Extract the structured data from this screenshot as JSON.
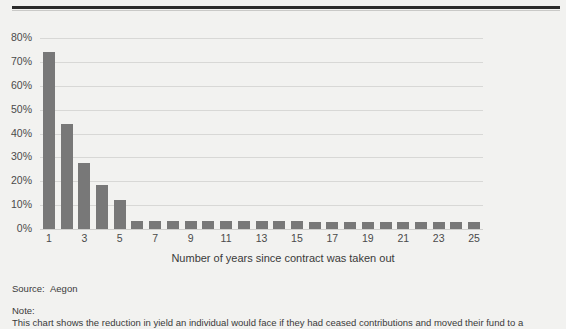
{
  "chart_data": {
    "type": "bar",
    "title": "",
    "xlabel": "Number of years since contract was taken out",
    "ylabel": "",
    "ylim": [
      0,
      80
    ],
    "grid": true,
    "legend": "none",
    "ytick_labels": [
      "80%",
      "70%",
      "60%",
      "50%",
      "40%",
      "30%",
      "20%",
      "10%",
      "0%"
    ],
    "ytick_values": [
      80,
      70,
      60,
      50,
      40,
      30,
      20,
      10,
      0
    ],
    "xtick_labels": [
      "1",
      "3",
      "5",
      "7",
      "9",
      "11",
      "13",
      "15",
      "17",
      "19",
      "21",
      "23",
      "25"
    ],
    "categories": [
      1,
      2,
      3,
      4,
      5,
      6,
      7,
      8,
      9,
      10,
      11,
      12,
      13,
      14,
      15,
      16,
      17,
      18,
      19,
      20,
      21,
      22,
      23,
      24,
      25
    ],
    "values": [
      74,
      44,
      27.5,
      18.5,
      12,
      3.5,
      3.2,
      3.2,
      3.2,
      3.2,
      3.2,
      3.2,
      3.2,
      3.2,
      3.2,
      3.0,
      3.0,
      3.0,
      3.0,
      3.0,
      3.0,
      3.0,
      3.0,
      3.0,
      3.0
    ],
    "bar_color": "#787878",
    "background_color": "#f2f2f0",
    "gridline_color": "#d8d8d6"
  },
  "footer": {
    "source_label": "Source:",
    "source_value": "Aegon",
    "note_label": "Note:",
    "note_value": "This chart shows the reduction in yield an individual would face if they had ceased contributions and moved their fund to a"
  }
}
